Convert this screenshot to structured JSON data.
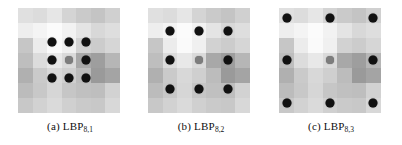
{
  "figure": {
    "name": "lbp-sampling-figure",
    "background": "#ffffff",
    "dot_color": "#111111",
    "center_dot_color": "#7d7d7d"
  },
  "panels": [
    {
      "id": "a",
      "index_label": "(a)",
      "operator": "LBP",
      "subscript": "8,1",
      "caption": "(a) LBP8,1",
      "neighbors": 8,
      "radius": 1,
      "grid": {
        "cols": 7,
        "rows": 7,
        "cells": [
          [
            "#e0e0e0",
            "#dcdcdc",
            "#e6e6e6",
            "#d4d4d4",
            "#cacaca",
            "#c4c4c4",
            "#d0d0d0"
          ],
          [
            "#eeeeee",
            "#f4f4f4",
            "#fbfbfb",
            "#f2f2f2",
            "#e4e4e4",
            "#d8d8d8",
            "#dedede"
          ],
          [
            "#c6c6c6",
            "#ececec",
            "#fafafa",
            "#f0f0f0",
            "#d2d2d2",
            "#cccccc",
            "#d6d6d6"
          ],
          [
            "#bebebe",
            "#dcdcdc",
            "#e8e8e8",
            "#dadada",
            "#a8a8a8",
            "#9e9e9e",
            "#b6b6b6"
          ],
          [
            "#b0b0b0",
            "#cacaca",
            "#d8d8d8",
            "#cfcfcf",
            "#bcbcbc",
            "#9a9a9a",
            "#a4a4a4"
          ],
          [
            "#bcbcbc",
            "#c8c8c8",
            "#d6d6d6",
            "#c6c6c6",
            "#c0c0c0",
            "#bebebe",
            "#d2d2d2"
          ],
          [
            "#c8c8c8",
            "#d2d2d2",
            "#dadada",
            "#d0d0d0",
            "#cacaca",
            "#c8c8c8",
            "#d8d8d8"
          ]
        ]
      },
      "dots": [
        {
          "x": 34,
          "y": 34,
          "type": "neighbor"
        },
        {
          "x": 51,
          "y": 34,
          "type": "neighbor"
        },
        {
          "x": 68,
          "y": 34,
          "type": "neighbor"
        },
        {
          "x": 34,
          "y": 52,
          "type": "neighbor"
        },
        {
          "x": 51,
          "y": 52,
          "type": "center"
        },
        {
          "x": 68,
          "y": 52,
          "type": "neighbor"
        },
        {
          "x": 34,
          "y": 70,
          "type": "neighbor"
        },
        {
          "x": 51,
          "y": 70,
          "type": "neighbor"
        },
        {
          "x": 68,
          "y": 70,
          "type": "neighbor"
        }
      ]
    },
    {
      "id": "b",
      "index_label": "(b)",
      "operator": "LBP",
      "subscript": "8,2",
      "caption": "(b) LBP8,2",
      "neighbors": 8,
      "radius": 2,
      "grid": {
        "cols": 7,
        "rows": 7,
        "cells": [
          [
            "#e0e0e0",
            "#dcdcdc",
            "#e6e6e6",
            "#d4d4d4",
            "#cacaca",
            "#c4c4c4",
            "#d0d0d0"
          ],
          [
            "#eeeeee",
            "#f4f4f4",
            "#fbfbfb",
            "#f2f2f2",
            "#e4e4e4",
            "#d8d8d8",
            "#dedede"
          ],
          [
            "#c6c6c6",
            "#ececec",
            "#fafafa",
            "#f0f0f0",
            "#d2d2d2",
            "#cccccc",
            "#d6d6d6"
          ],
          [
            "#bebebe",
            "#dcdcdc",
            "#e8e8e8",
            "#dadada",
            "#a8a8a8",
            "#9e9e9e",
            "#b6b6b6"
          ],
          [
            "#b0b0b0",
            "#cacaca",
            "#d8d8d8",
            "#cfcfcf",
            "#bcbcbc",
            "#9a9a9a",
            "#a4a4a4"
          ],
          [
            "#bcbcbc",
            "#c8c8c8",
            "#d6d6d6",
            "#c6c6c6",
            "#c0c0c0",
            "#bebebe",
            "#d2d2d2"
          ],
          [
            "#c8c8c8",
            "#d2d2d2",
            "#dadada",
            "#d0d0d0",
            "#cacaca",
            "#c8c8c8",
            "#d8d8d8"
          ]
        ]
      },
      "dots": [
        {
          "x": 22,
          "y": 23,
          "type": "neighbor"
        },
        {
          "x": 51,
          "y": 23,
          "type": "neighbor"
        },
        {
          "x": 80,
          "y": 23,
          "type": "neighbor"
        },
        {
          "x": 22,
          "y": 52,
          "type": "neighbor"
        },
        {
          "x": 51,
          "y": 52,
          "type": "center"
        },
        {
          "x": 80,
          "y": 52,
          "type": "neighbor"
        },
        {
          "x": 22,
          "y": 81,
          "type": "neighbor"
        },
        {
          "x": 51,
          "y": 81,
          "type": "neighbor"
        },
        {
          "x": 80,
          "y": 81,
          "type": "neighbor"
        }
      ]
    },
    {
      "id": "c",
      "index_label": "(c)",
      "operator": "LBP",
      "subscript": "8,3",
      "caption": "(c) LBP8,3",
      "neighbors": 8,
      "radius": 3,
      "grid": {
        "cols": 7,
        "rows": 7,
        "cells": [
          [
            "#e0e0e0",
            "#dcdcdc",
            "#e6e6e6",
            "#d4d4d4",
            "#cacaca",
            "#c4c4c4",
            "#d0d0d0"
          ],
          [
            "#eeeeee",
            "#f4f4f4",
            "#fbfbfb",
            "#f2f2f2",
            "#e4e4e4",
            "#d8d8d8",
            "#dedede"
          ],
          [
            "#c6c6c6",
            "#ececec",
            "#fafafa",
            "#f0f0f0",
            "#d2d2d2",
            "#cccccc",
            "#d6d6d6"
          ],
          [
            "#bebebe",
            "#dcdcdc",
            "#e8e8e8",
            "#dadada",
            "#a8a8a8",
            "#9e9e9e",
            "#b6b6b6"
          ],
          [
            "#b0b0b0",
            "#cacaca",
            "#d8d8d8",
            "#cfcfcf",
            "#bcbcbc",
            "#9a9a9a",
            "#a4a4a4"
          ],
          [
            "#bcbcbc",
            "#c8c8c8",
            "#d6d6d6",
            "#c6c6c6",
            "#c0c0c0",
            "#bebebe",
            "#d2d2d2"
          ],
          [
            "#c8c8c8",
            "#d2d2d2",
            "#dadada",
            "#d0d0d0",
            "#cacaca",
            "#c8c8c8",
            "#d8d8d8"
          ]
        ]
      },
      "dots": [
        {
          "x": 8,
          "y": 10,
          "type": "neighbor"
        },
        {
          "x": 51,
          "y": 10,
          "type": "neighbor"
        },
        {
          "x": 94,
          "y": 10,
          "type": "neighbor"
        },
        {
          "x": 8,
          "y": 52,
          "type": "neighbor"
        },
        {
          "x": 51,
          "y": 52,
          "type": "center"
        },
        {
          "x": 94,
          "y": 52,
          "type": "neighbor"
        },
        {
          "x": 8,
          "y": 95,
          "type": "neighbor"
        },
        {
          "x": 51,
          "y": 95,
          "type": "neighbor"
        },
        {
          "x": 94,
          "y": 95,
          "type": "neighbor"
        }
      ]
    }
  ]
}
